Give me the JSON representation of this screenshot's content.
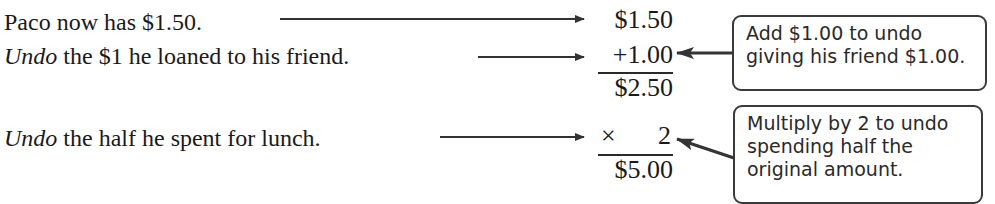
{
  "steps": [
    {
      "prefix": "",
      "text": "Paco now has $1.50."
    },
    {
      "prefix": "Undo",
      "text": " the $1 he loaned to his friend."
    },
    {
      "prefix": "Undo",
      "text": " the half he spent for lunch."
    }
  ],
  "computation": {
    "start": "$1.50",
    "add": "+1.00",
    "subtotal": "$2.50",
    "multiply_sign": "×",
    "multiply_value": "2",
    "result": "$5.00"
  },
  "callouts": [
    {
      "lines": [
        "Add $1.00 to undo",
        "giving his friend $1.00."
      ]
    },
    {
      "lines": [
        "Multiply by 2 to undo",
        "spending half the",
        "original amount."
      ]
    }
  ],
  "colors": {
    "text": "#1a1a1a",
    "box_border": "#3a3a3a",
    "arrow": "#333333"
  }
}
